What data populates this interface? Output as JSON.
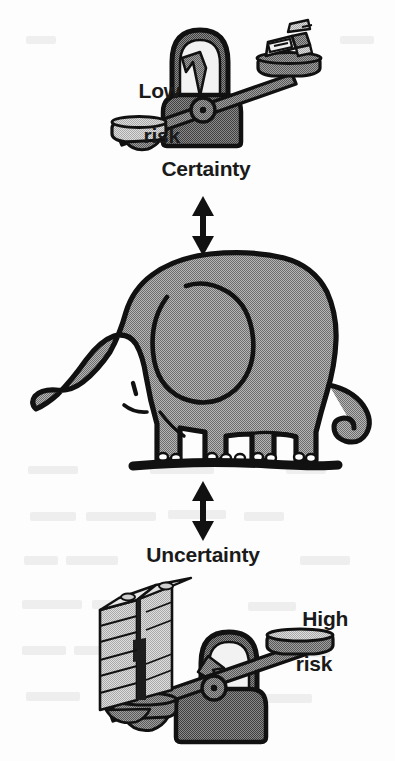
{
  "figure": {
    "background_color": "#fdfdfd",
    "ink_color": "#111111",
    "fill_gray": "#989898",
    "fill_light_gray": "#c9c9c9",
    "fill_dark_gray": "#6f6f6f"
  },
  "labels": {
    "low_risk_line1": "Low",
    "low_risk_line2": "risk",
    "certainty": "Certainty",
    "uncertainty": "Uncertainty",
    "high_risk_line1": "High",
    "high_risk_line2": "risk"
  },
  "elements": {
    "top_scale": {
      "name": "balance-scale-low-risk",
      "left_pan_state": "empty",
      "right_pan_state": "loaded-with-money",
      "beam_tilt": "right-side-up",
      "gauge": "dial-with-pointer"
    },
    "bottom_scale": {
      "name": "balance-scale-high-risk",
      "left_pan_state": "loaded-with-money",
      "right_pan_state": "empty",
      "beam_tilt": "left-side-down",
      "gauge": "dial-with-pointer"
    },
    "elephant": {
      "name": "elephant",
      "facing": "left",
      "parts": [
        "trunk",
        "ear",
        "tail",
        "four-legs",
        "toenails",
        "ground-line"
      ]
    },
    "arrows": [
      {
        "name": "arrow-certainty-to-elephant",
        "type": "double-headed",
        "orientation": "vertical"
      },
      {
        "name": "arrow-elephant-to-uncertainty",
        "type": "double-headed",
        "orientation": "vertical"
      }
    ]
  }
}
